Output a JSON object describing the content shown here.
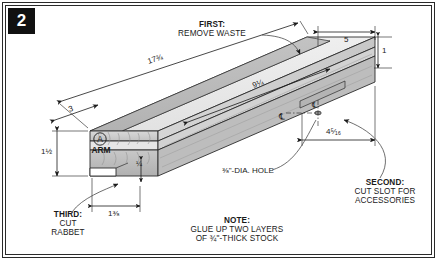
{
  "figure": {
    "step_number": "2",
    "type": "woodworking-exploded-dimension-drawing"
  },
  "callouts": {
    "first": {
      "heading": "FIRST:",
      "body": "REMOVE WASTE"
    },
    "second": {
      "heading": "SECOND:",
      "body_line1": "CUT SLOT FOR",
      "body_line2": "ACCESSORIES"
    },
    "third": {
      "heading": "THIRD:",
      "body_line1": "CUT",
      "body_line2": "RABBET"
    },
    "note": {
      "heading": "NOTE:",
      "body_line1": "GLUE UP TWO LAYERS",
      "body_line2": "OF ¾\"-THICK STOCK"
    }
  },
  "part": {
    "tag": "A",
    "name": "ARM"
  },
  "dimensions": [
    {
      "id": "overall-length",
      "value": "17¾",
      "whole": "17",
      "frac": "3/4"
    },
    {
      "id": "top-face-length",
      "value": "9¼",
      "whole": "9",
      "frac": "1/4"
    },
    {
      "id": "left-offset",
      "value": "3",
      "whole": "3",
      "frac": ""
    },
    {
      "id": "right-offset",
      "value": "5",
      "whole": "5",
      "frac": ""
    },
    {
      "id": "right-end",
      "value": "1",
      "whole": "1",
      "frac": ""
    },
    {
      "id": "height",
      "value": "1½",
      "whole": "1",
      "frac": "1/2"
    },
    {
      "id": "slot-depth",
      "value": "¼",
      "whole": "",
      "frac": "1/4"
    },
    {
      "id": "rabbet-width",
      "value": "1⅜",
      "whole": "1",
      "frac": "3/8"
    },
    {
      "id": "hole-centerline",
      "value": "4⁵⁄₁₆",
      "whole": "4",
      "frac": "5/16"
    }
  ],
  "hole_note": {
    "diameter": "⅜",
    "text": "\"-DIA. HOLE"
  },
  "symbols": {
    "centerline": "℄",
    "part_tag_shape": "circled-letter"
  },
  "colors": {
    "frame": "#2a2a2a",
    "badge_bg": "#111111",
    "badge_fg": "#ffffff",
    "board_top": "#ececec",
    "board_top_shaded": "#b8b8b8",
    "board_front": "#cfcfcf",
    "board_front_dark": "#a9a9a9",
    "board_end": "#d8d8d8",
    "outline": "#2b2b2b",
    "leader": "#5d5d5d"
  }
}
